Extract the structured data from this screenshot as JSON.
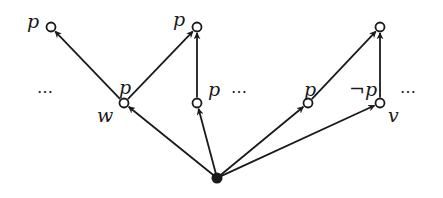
{
  "diagram": {
    "type": "kripke-frame",
    "colors": {
      "stroke": "#1a1a1a",
      "background": "#ffffff"
    },
    "nodes": [
      {
        "id": "root",
        "x": 217,
        "y": 178,
        "filled": true,
        "label": "",
        "label_pos": ""
      },
      {
        "id": "w",
        "x": 124,
        "y": 103,
        "filled": false,
        "label": "p",
        "label_pos": "above",
        "name": "w"
      },
      {
        "id": "m1",
        "x": 197,
        "y": 103,
        "filled": false,
        "label": "p",
        "label_pos": "right"
      },
      {
        "id": "m2",
        "x": 308,
        "y": 103,
        "filled": false,
        "label": "p",
        "label_pos": "above"
      },
      {
        "id": "v",
        "x": 380,
        "y": 103,
        "filled": false,
        "label": "¬p",
        "label_pos": "left",
        "name": "v"
      },
      {
        "id": "t1",
        "x": 51,
        "y": 27,
        "filled": false,
        "label": "p",
        "label_pos": "left"
      },
      {
        "id": "t2",
        "x": 197,
        "y": 27,
        "filled": false,
        "label": "p",
        "label_pos": "left"
      },
      {
        "id": "t3",
        "x": 380,
        "y": 27,
        "filled": false,
        "label": "",
        "label_pos": ""
      }
    ],
    "edges": [
      {
        "from": "root",
        "to": "w"
      },
      {
        "from": "root",
        "to": "m1"
      },
      {
        "from": "root",
        "to": "m2"
      },
      {
        "from": "root",
        "to": "v"
      },
      {
        "from": "w",
        "to": "t1"
      },
      {
        "from": "w",
        "to": "t2"
      },
      {
        "from": "m1",
        "to": "t2"
      },
      {
        "from": "m2",
        "to": "t3"
      },
      {
        "from": "v",
        "to": "t3"
      }
    ],
    "labels": {
      "w_name": "w",
      "v_name": "v",
      "w_prop": "p",
      "m1_prop": "p",
      "m2_prop": "p",
      "v_prop": "¬p",
      "t1_prop": "p",
      "t2_prop": "p"
    },
    "ellipses": [
      "…",
      "…",
      "…"
    ]
  }
}
